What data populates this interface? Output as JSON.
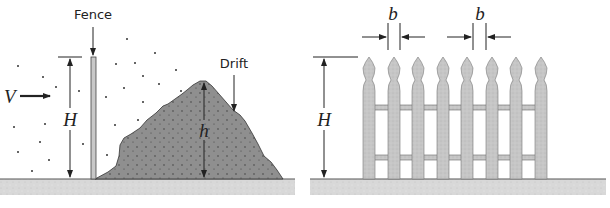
{
  "left_panel": {
    "fence_label": "Fence",
    "drift_label": "Drift",
    "wind_label": "V",
    "fence_height_label": "H",
    "drift_height_label": "h"
  },
  "right_panel": {
    "fence_height_label": "H",
    "gap_labels": [
      "b",
      "b"
    ],
    "picket_count": 8,
    "rail_count": 2
  },
  "colors": {
    "ground": "#d6d6d6",
    "drift": "#8c8c8c",
    "picket": "#c4c4c4",
    "line": "#222222"
  }
}
